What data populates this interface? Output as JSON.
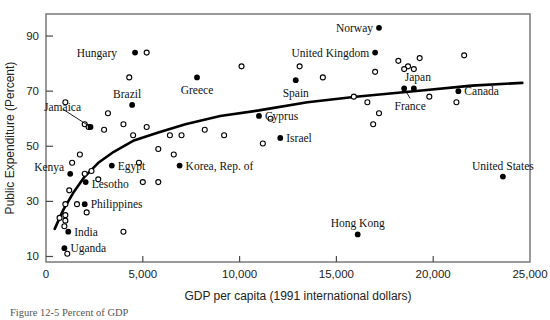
{
  "figure": {
    "caption_partial": "Figure  12-5 Percent of GDP"
  },
  "chart_data": {
    "type": "scatter",
    "title": "",
    "xlabel": "GDP per capita (1991 international dollars)",
    "ylabel": "Public Expenditure (Percent)",
    "xlim": [
      0,
      25000
    ],
    "ylim": [
      8,
      98
    ],
    "grid": false,
    "legend": "none",
    "xticks": [
      0,
      5000,
      10000,
      15000,
      20000,
      25000
    ],
    "xticklabels": [
      "0",
      "5,000",
      "10,000",
      "15,000",
      "20,000",
      "25,000"
    ],
    "yticks": [
      10,
      30,
      50,
      70,
      90
    ],
    "yticklabels": [
      "10",
      "30",
      "50",
      "70",
      "90"
    ],
    "series": [
      {
        "name": "Labeled countries",
        "marker": "filled-circle",
        "color": "#000000",
        "points": [
          {
            "label": "Hungary",
            "x": 4600,
            "y": 84,
            "label_dx": -18,
            "label_dy": 0,
            "label_anchor": "end",
            "leader": false
          },
          {
            "label": "Brazil",
            "x": 4450,
            "y": 65,
            "label_dx": -5,
            "label_dy": -11,
            "label_anchor": "middle",
            "leader": false
          },
          {
            "label": "Jamaica",
            "x": 2300,
            "y": 57,
            "label_dx": -28,
            "label_dy": -20,
            "label_anchor": "middle",
            "leader": true
          },
          {
            "label": "Greece",
            "x": 7800,
            "y": 75,
            "label_dx": 0,
            "label_dy": 13,
            "label_anchor": "middle",
            "leader": false
          },
          {
            "label": "Spain",
            "x": 12900,
            "y": 74,
            "label_dx": 0,
            "label_dy": 13,
            "label_anchor": "middle",
            "leader": false
          },
          {
            "label": "Norway",
            "x": 17200,
            "y": 93,
            "label_dx": -6,
            "label_dy": 0,
            "label_anchor": "end",
            "leader": false
          },
          {
            "label": "United Kingdom",
            "x": 17000,
            "y": 84,
            "label_dx": -6,
            "label_dy": 0,
            "label_anchor": "end",
            "leader": false
          },
          {
            "label": "Japan",
            "x": 19000,
            "y": 71,
            "label_dx": 4,
            "label_dy": -11,
            "label_anchor": "middle",
            "leader": false
          },
          {
            "label": "France",
            "x": 18500,
            "y": 71,
            "label_dx": 6,
            "label_dy": 18,
            "label_anchor": "middle",
            "leader": true
          },
          {
            "label": "Canada",
            "x": 21300,
            "y": 70,
            "label_dx": 6,
            "label_dy": 0,
            "label_anchor": "start",
            "leader": false
          },
          {
            "label": "Cyprus",
            "x": 11000,
            "y": 61,
            "label_dx": 6,
            "label_dy": 0,
            "label_anchor": "start",
            "leader": false
          },
          {
            "label": "Israel",
            "x": 12100,
            "y": 53,
            "label_dx": 6,
            "label_dy": 0,
            "label_anchor": "start",
            "leader": false
          },
          {
            "label": "Korea, Rep. of",
            "x": 6900,
            "y": 43,
            "label_dx": 6,
            "label_dy": 0,
            "label_anchor": "start",
            "leader": false
          },
          {
            "label": "Egypt",
            "x": 3400,
            "y": 43,
            "label_dx": 6,
            "label_dy": 0,
            "label_anchor": "start",
            "leader": false
          },
          {
            "label": "Kenya",
            "x": 1250,
            "y": 40,
            "label_dx": -6,
            "label_dy": -7,
            "label_anchor": "end",
            "leader": false
          },
          {
            "label": "Lesotho",
            "x": 2050,
            "y": 37,
            "label_dx": 6,
            "label_dy": 2,
            "label_anchor": "start",
            "leader": false
          },
          {
            "label": "Philippines",
            "x": 2000,
            "y": 29,
            "label_dx": 6,
            "label_dy": 0,
            "label_anchor": "start",
            "leader": false
          },
          {
            "label": "India",
            "x": 1150,
            "y": 19,
            "label_dx": 6,
            "label_dy": 0,
            "label_anchor": "start",
            "leader": false
          },
          {
            "label": "Uganda",
            "x": 950,
            "y": 13,
            "label_dx": 6,
            "label_dy": 0,
            "label_anchor": "start",
            "leader": false
          },
          {
            "label": "Hong Kong",
            "x": 16100,
            "y": 18,
            "label_dx": 0,
            "label_dy": -11,
            "label_anchor": "middle",
            "leader": false
          },
          {
            "label": "United States",
            "x": 23600,
            "y": 39,
            "label_dx": 0,
            "label_dy": -11,
            "label_anchor": "middle",
            "leader": false
          }
        ]
      },
      {
        "name": "Unlabeled countries",
        "marker": "open-circle",
        "color": "#000000",
        "points": [
          {
            "x": 5200,
            "y": 84
          },
          {
            "x": 4300,
            "y": 75
          },
          {
            "x": 10100,
            "y": 79
          },
          {
            "x": 13100,
            "y": 79
          },
          {
            "x": 17000,
            "y": 77
          },
          {
            "x": 18200,
            "y": 81
          },
          {
            "x": 19300,
            "y": 82
          },
          {
            "x": 18700,
            "y": 79
          },
          {
            "x": 19000,
            "y": 78
          },
          {
            "x": 18500,
            "y": 78
          },
          {
            "x": 21600,
            "y": 83
          },
          {
            "x": 1000,
            "y": 66
          },
          {
            "x": 2000,
            "y": 58
          },
          {
            "x": 2200,
            "y": 57
          },
          {
            "x": 3000,
            "y": 56
          },
          {
            "x": 3200,
            "y": 62
          },
          {
            "x": 4000,
            "y": 58
          },
          {
            "x": 4500,
            "y": 54
          },
          {
            "x": 5200,
            "y": 57
          },
          {
            "x": 6400,
            "y": 54
          },
          {
            "x": 7000,
            "y": 54
          },
          {
            "x": 8200,
            "y": 56
          },
          {
            "x": 9200,
            "y": 54
          },
          {
            "x": 11600,
            "y": 60
          },
          {
            "x": 14300,
            "y": 75
          },
          {
            "x": 15900,
            "y": 68
          },
          {
            "x": 16600,
            "y": 66
          },
          {
            "x": 17200,
            "y": 62
          },
          {
            "x": 19800,
            "y": 68
          },
          {
            "x": 21200,
            "y": 66
          },
          {
            "x": 16900,
            "y": 58
          },
          {
            "x": 11200,
            "y": 51
          },
          {
            "x": 5800,
            "y": 49
          },
          {
            "x": 6600,
            "y": 47
          },
          {
            "x": 1750,
            "y": 47
          },
          {
            "x": 1350,
            "y": 44
          },
          {
            "x": 2350,
            "y": 41
          },
          {
            "x": 2000,
            "y": 40
          },
          {
            "x": 4800,
            "y": 44
          },
          {
            "x": 1200,
            "y": 34
          },
          {
            "x": 2700,
            "y": 38
          },
          {
            "x": 5000,
            "y": 37
          },
          {
            "x": 5800,
            "y": 37
          },
          {
            "x": 1000,
            "y": 29
          },
          {
            "x": 1600,
            "y": 29
          },
          {
            "x": 2100,
            "y": 26
          },
          {
            "x": 1000,
            "y": 25
          },
          {
            "x": 1000,
            "y": 23
          },
          {
            "x": 950,
            "y": 21
          },
          {
            "x": 700,
            "y": 24
          },
          {
            "x": 4000,
            "y": 19
          },
          {
            "x": 1100,
            "y": 11
          }
        ]
      }
    ],
    "fit_curve": {
      "name": "fitted logarithmic trend",
      "color": "#000000",
      "points": [
        {
          "x": 450,
          "y": 20
        },
        {
          "x": 900,
          "y": 27
        },
        {
          "x": 1400,
          "y": 33
        },
        {
          "x": 2000,
          "y": 39
        },
        {
          "x": 2700,
          "y": 44
        },
        {
          "x": 3500,
          "y": 48
        },
        {
          "x": 4500,
          "y": 52
        },
        {
          "x": 5800,
          "y": 55
        },
        {
          "x": 7200,
          "y": 58
        },
        {
          "x": 9000,
          "y": 61
        },
        {
          "x": 11000,
          "y": 63
        },
        {
          "x": 13500,
          "y": 66
        },
        {
          "x": 16000,
          "y": 68
        },
        {
          "x": 19000,
          "y": 70
        },
        {
          "x": 22000,
          "y": 72
        },
        {
          "x": 24600,
          "y": 73
        }
      ]
    }
  }
}
